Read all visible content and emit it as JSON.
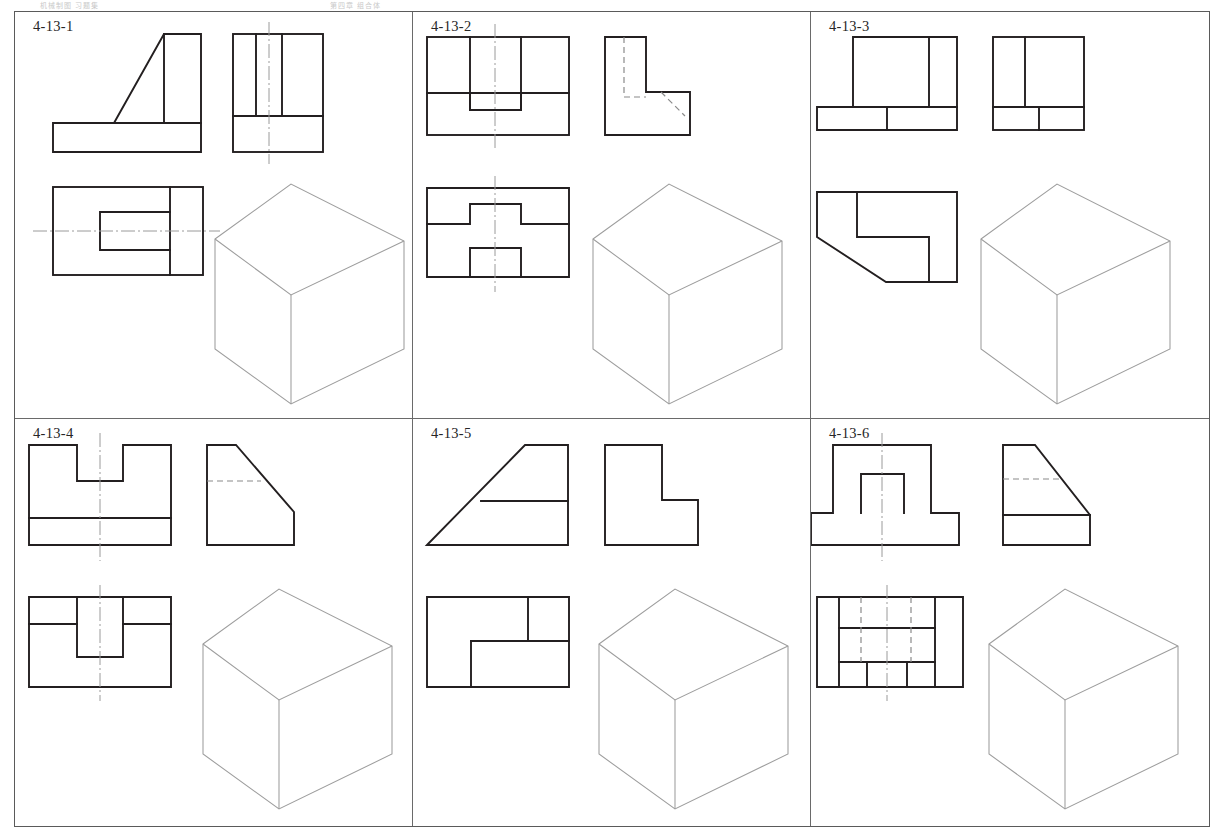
{
  "document": {
    "type": "orthographic-projection-worksheet",
    "header_text_left": "机械制图  习题集",
    "header_text_right": "第四章  组合体",
    "sheet_border": true,
    "grid_rows": 2,
    "grid_columns": 3
  },
  "colors": {
    "visible_line": "#231f20",
    "hidden_line": "#8a8a8a",
    "center_line": "#9a9a9a",
    "isometric_box": "#9d9d9d",
    "cell_border": "#6a6a6a",
    "sheet_border": "#5a5a5a",
    "background": "#ffffff"
  },
  "exercises": [
    {
      "id": "4-13-1",
      "label": "4-13-1",
      "description": "Right-angle bracket with inclined face, vertical rib and through slot in top view",
      "views": {
        "front": {
          "name": "front-view",
          "outline": "99,94 99,64 149,64 149,28 186,28 186,140 38,140 38,111 99,111",
          "features": [
            "inclined-face",
            "base-plate"
          ],
          "has_center_line": false
        },
        "side": {
          "name": "side-view",
          "outline_rect": {
            "x": 218,
            "y": 28,
            "w": 90,
            "h": 112
          },
          "internal_lines": [
            "vertical-rib-left",
            "vertical-rib-right",
            "base-plate-top"
          ],
          "has_center_line": true
        },
        "top": {
          "name": "top-view",
          "outline_rect": {
            "x": 38,
            "y": 175,
            "w": 150,
            "h": 88
          },
          "features": [
            "slot",
            "rib-edge"
          ],
          "has_center_line": true
        },
        "isometric": {
          "name": "isometric-construction-box",
          "filled": false,
          "note": "blank box for student drawing"
        }
      }
    },
    {
      "id": "4-13-2",
      "label": "4-13-2",
      "description": "Rectangular block with central top channel and bottom notch",
      "views": {
        "front": {
          "name": "front-view",
          "outline_rect": {
            "x": 14,
            "y": 25,
            "w": 142,
            "h": 98
          },
          "features": [
            "channel-left-wall",
            "channel-right-wall",
            "base-plate-top",
            "notch"
          ],
          "has_center_line": true
        },
        "side": {
          "name": "side-view",
          "outline": "192,25 233,25 233,80 277,80 277,123 192,123",
          "features": [
            "hidden-vertical",
            "hidden-diagonal"
          ],
          "has_center_line": false
        },
        "top": {
          "name": "top-view",
          "outline_rect": {
            "x": 14,
            "y": 176,
            "w": 142,
            "h": 89
          },
          "features": [
            "upper-step",
            "lower-tab"
          ],
          "has_center_line": true
        },
        "isometric": {
          "name": "isometric-construction-box",
          "filled": false,
          "note": "blank box for student drawing"
        }
      }
    },
    {
      "id": "4-13-3",
      "label": "4-13-3",
      "description": "Stepped block, top view has chamfered corner and L-shaped recess",
      "views": {
        "front": {
          "name": "front-view",
          "outline": "42,25 146,25 146,118 42,118",
          "features": [
            "tall-block",
            "base-step-left",
            "base-step-right"
          ],
          "has_center_line": false
        },
        "side": {
          "name": "side-view",
          "outline_rect": {
            "x": 182,
            "y": 25,
            "w": 91,
            "h": 93
          },
          "features": [
            "vertical-divider",
            "base-plate-top",
            "base-divider"
          ],
          "has_center_line": false
        },
        "top": {
          "name": "top-view",
          "outline": "chamfered-rectangle-with-L-recess",
          "features": [
            "chamfer",
            "L-recess"
          ],
          "has_center_line": false
        },
        "isometric": {
          "name": "isometric-construction-box",
          "filled": false,
          "note": "blank box for student drawing"
        }
      }
    },
    {
      "id": "4-13-4",
      "label": "4-13-4",
      "description": "Slotted block on base plate with chamfered side view",
      "views": {
        "front": {
          "name": "front-view",
          "outline_rect": {
            "x": 14,
            "y": 26,
            "w": 142,
            "h": 100
          },
          "features": [
            "top-slot",
            "base-plate-top"
          ],
          "has_center_line": true
        },
        "side": {
          "name": "side-view",
          "outline": "192,26 221,26 279,93 279,126 192,126",
          "features": [
            "chamfer",
            "hidden-slot-depth"
          ],
          "has_center_line": false
        },
        "top": {
          "name": "top-view",
          "outline_rect": {
            "x": 14,
            "y": 178,
            "w": 142,
            "h": 90
          },
          "features": [
            "slot-walls",
            "step-line-left",
            "step-line-right"
          ],
          "has_center_line": true
        },
        "isometric": {
          "name": "isometric-construction-box",
          "filled": false,
          "note": "blank box for student drawing"
        }
      }
    },
    {
      "id": "4-13-5",
      "label": "4-13-5",
      "description": "Wedge-shaped block with L-shaped side view",
      "views": {
        "front": {
          "name": "front-view",
          "outline": "14,126 112,26 155,26 155,126",
          "features": [
            "inclined-face",
            "horizontal-split"
          ],
          "has_center_line": false
        },
        "side": {
          "name": "side-view",
          "outline": "192,26 249,26 249,81 285,81 285,126 192,126",
          "features": [
            "L-profile"
          ],
          "has_center_line": false
        },
        "top": {
          "name": "top-view",
          "outline_rect": {
            "x": 14,
            "y": 178,
            "w": 142,
            "h": 90
          },
          "features": [
            "corner-step",
            "inner-step"
          ],
          "has_center_line": false
        },
        "isometric": {
          "name": "isometric-construction-box",
          "filled": false,
          "note": "blank box for student drawing"
        }
      }
    },
    {
      "id": "4-13-6",
      "label": "4-13-6",
      "description": "Inverted-U rib on base plate with chamfered side view",
      "views": {
        "front": {
          "name": "front-view",
          "outline": "inverted-U-on-base",
          "features": [
            "U-channel",
            "base-plate"
          ],
          "has_center_line": true
        },
        "side": {
          "name": "side-view",
          "outline": "192,26 224,26 279,96 279,126 192,126",
          "features": [
            "chamfer",
            "hidden-rib-line",
            "base-plate-top"
          ],
          "has_center_line": false
        },
        "top": {
          "name": "top-view",
          "outline_rect": {
            "x": 14,
            "y": 178,
            "w": 146,
            "h": 90
          },
          "features": [
            "U-slot",
            "hidden-rib-edges",
            "rib-top-line"
          ],
          "has_center_line": true
        },
        "isometric": {
          "name": "isometric-construction-box",
          "filled": false,
          "note": "blank box for student drawing"
        }
      }
    }
  ]
}
